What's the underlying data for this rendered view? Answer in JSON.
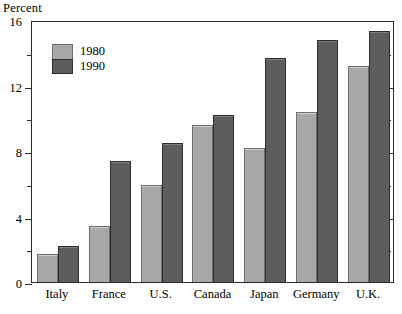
{
  "chart_data": {
    "type": "bar",
    "title": "",
    "ylabel": "Percent",
    "xlabel": "",
    "ylim": [
      0,
      16
    ],
    "ytick_major": [
      0,
      4,
      8,
      12,
      16
    ],
    "ytick_minor": [
      2,
      6,
      10,
      14
    ],
    "ytick_labels": [
      "0",
      "4",
      "8",
      "12",
      "16"
    ],
    "grid": false,
    "legend_position": "top-left",
    "categories": [
      "Italy",
      "France",
      "U.S.",
      "Canada",
      "Japan",
      "Germany",
      "U.K."
    ],
    "series": [
      {
        "name": "1980",
        "color": "#a8a8a8",
        "values": [
          1.7,
          3.4,
          5.9,
          9.6,
          8.2,
          10.4,
          13.2
        ]
      },
      {
        "name": "1990",
        "color": "#5d5d5d",
        "values": [
          2.2,
          7.4,
          8.5,
          10.2,
          13.7,
          14.8,
          15.3
        ]
      }
    ]
  }
}
